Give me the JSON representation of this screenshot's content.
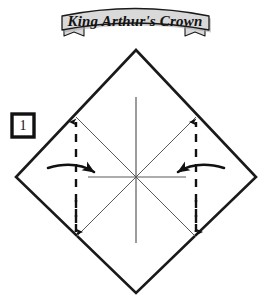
{
  "page": {
    "title": "King Arthur's Crown",
    "background_color": "#ffffff",
    "width": 269,
    "height": 298
  },
  "banner": {
    "label": "King Arthur's Crown",
    "fill_color": "#d9d9d9",
    "stroke_color": "#1a1a1a",
    "shadow_color": "#a8a8a8",
    "tail_left": "ribbon-tail-left",
    "tail_right": "ribbon-tail-right"
  },
  "step_marker": {
    "number": "1",
    "box_stroke_color": "#111111",
    "box_fill_color": "#ffffff"
  },
  "diagram": {
    "name": "origami-square-precrease",
    "shape": "diamond",
    "outline_color": "#1a1a1a",
    "crease_color": "#555555",
    "fold_line_color": "#111111",
    "arrow_color": "#111111",
    "vertices": {
      "top": [
        136,
        50
      ],
      "right": [
        256,
        177
      ],
      "bottom": [
        136,
        293
      ],
      "left": [
        16,
        177
      ]
    },
    "center": [
      136,
      177
    ],
    "creases": [
      {
        "name": "vertical-crease",
        "from": [
          136,
          97
        ],
        "to": [
          136,
          243
        ],
        "style": "solid"
      },
      {
        "name": "horizontal-crease",
        "from": [
          88,
          177
        ],
        "to": [
          186,
          177
        ],
        "style": "solid"
      },
      {
        "name": "diagonal-crease-nw-se",
        "from": [
          76,
          117
        ],
        "to": [
          196,
          237
        ],
        "style": "solid"
      },
      {
        "name": "diagonal-crease-ne-sw",
        "from": [
          196,
          117
        ],
        "to": [
          76,
          237
        ],
        "style": "solid"
      }
    ],
    "fold_lines": [
      {
        "name": "valley-fold-left",
        "x": 76,
        "from_y": 117,
        "to_y": 237,
        "style": "dashed",
        "arrowheads": "both"
      },
      {
        "name": "valley-fold-right",
        "x": 196,
        "from_y": 117,
        "to_y": 237,
        "style": "dashed",
        "arrowheads": "both"
      }
    ],
    "arrows": [
      {
        "name": "fold-arrow-left",
        "direction": "right",
        "from": [
          50,
          168
        ],
        "to": [
          100,
          173
        ]
      },
      {
        "name": "fold-arrow-right",
        "direction": "left",
        "from": [
          222,
          168
        ],
        "to": [
          172,
          173
        ]
      }
    ]
  }
}
